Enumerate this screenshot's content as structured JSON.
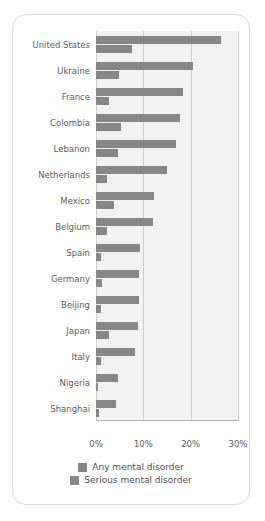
{
  "chart_data": {
    "type": "bar",
    "orientation": "horizontal",
    "title": "",
    "subtitle": "",
    "xlabel": "",
    "ylabel": "",
    "xlim": [
      0,
      30
    ],
    "xticks": [
      0,
      10,
      20,
      30
    ],
    "xtick_labels": [
      "0%",
      "10%",
      "20%",
      "30%"
    ],
    "grid": "vertical",
    "legend_position": "bottom-center",
    "categories": [
      "United States",
      "Ukraine",
      "France",
      "Colombia",
      "Lebanon",
      "Netherlands",
      "Mexico",
      "Belgium",
      "Spain",
      "Germany",
      "Beijing",
      "Japan",
      "Italy",
      "Nigeria",
      "Shanghai"
    ],
    "series": [
      {
        "name": "Any mental disorder",
        "color": "#878787",
        "values": [
          26.4,
          20.5,
          18.4,
          17.8,
          16.9,
          14.9,
          12.2,
          12.0,
          9.2,
          9.1,
          9.1,
          8.8,
          8.2,
          4.7,
          4.3
        ]
      },
      {
        "name": "Serious mental disorder",
        "color": "#878787",
        "values": [
          7.7,
          4.8,
          2.7,
          5.2,
          4.6,
          2.3,
          3.7,
          2.4,
          1.0,
          1.2,
          1.1,
          2.8,
          1.0,
          0.4,
          0.6
        ]
      }
    ]
  },
  "legend": {
    "items": [
      {
        "label": "Any mental disorder"
      },
      {
        "label": "Serious mental disorder"
      }
    ]
  },
  "colors": {
    "bar": "#878787",
    "plot_background": "#f2f2f2",
    "gridline": "#cfcfcf",
    "card_border": "#d9d9d9",
    "tick_text": "#5b5b5b"
  }
}
